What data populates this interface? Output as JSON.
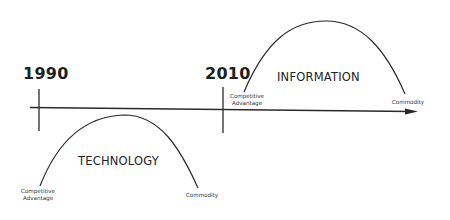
{
  "diagram": {
    "timeline": {
      "years": [
        {
          "label": "1990"
        },
        {
          "label": "2010"
        }
      ]
    },
    "curves": [
      {
        "name": "TECHNOLOGY",
        "start_label_line1": "Competitive",
        "start_label_line2": "Advantage",
        "end_label": "Commodity"
      },
      {
        "name": "INFORMATION",
        "start_label_line1": "Competitive",
        "start_label_line2": "Advantage",
        "end_label": "Commodity"
      }
    ],
    "colors": {
      "line": "#2a2a2a",
      "text": "#1e1e1e",
      "background": "#ffffff"
    }
  }
}
